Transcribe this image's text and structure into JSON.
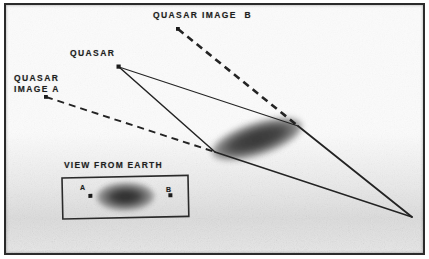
{
  "figure": {
    "background_color": "#fbfbfb",
    "ink_color": "#1e1e1e",
    "frame": {
      "border_color": "#2b2b2b",
      "border_width_px": 2
    }
  },
  "labels": {
    "quasar": "QUASAR",
    "quasar_image_a": "QUASAR\nIMAGE A",
    "quasar_image_b": "QUASAR IMAGE  B",
    "view_from_earth": "VIEW FROM EARTH",
    "inset_a": "A",
    "inset_b": "B"
  },
  "points": {
    "quasar": {
      "x": 113,
      "y": 62,
      "label": "QUASAR"
    },
    "quasar_image_a": {
      "x": 40,
      "y": 92,
      "label": "QUASAR IMAGE A"
    },
    "quasar_image_b": {
      "x": 172,
      "y": 24,
      "label": "QUASAR IMAGE B"
    },
    "observer_earth": {
      "x": 406,
      "y": 212,
      "label": "Earth observer"
    },
    "lens_left_tip": {
      "x": 209,
      "y": 147,
      "label": "lensing galaxy near edge"
    },
    "lens_right_tip": {
      "x": 292,
      "y": 121,
      "label": "lensing galaxy far edge"
    }
  },
  "lens_galaxy": {
    "center_x": 251,
    "center_y": 134,
    "radius_x": 47,
    "radius_y": 16,
    "rotation_deg": -18,
    "fill_color": "#3a3a3a"
  },
  "rays": [
    {
      "name": "ray-quasar-to-lens-near",
      "style": "solid",
      "from": "quasar",
      "to": "lens_left_tip"
    },
    {
      "name": "ray-quasar-to-lens-far",
      "style": "solid",
      "from": "quasar",
      "to": "lens_right_tip"
    },
    {
      "name": "ray-lens-near-to-earth",
      "style": "solid",
      "from": "lens_left_tip",
      "to": "observer_earth"
    },
    {
      "name": "ray-lens-far-to-earth",
      "style": "solid",
      "from": "lens_right_tip",
      "to": "observer_earth"
    },
    {
      "name": "sightline-image-a",
      "style": "dashed",
      "from": "quasar_image_a",
      "to": "observer_earth"
    },
    {
      "name": "sightline-image-b",
      "style": "dashed",
      "from": "quasar_image_b",
      "to": "observer_earth"
    }
  ],
  "inset": {
    "caption": "VIEW FROM EARTH",
    "box": {
      "x": 56,
      "y": 173,
      "width": 126,
      "height": 41,
      "rotation_deg": -1.2
    },
    "galaxy": {
      "center_x": 119,
      "center_y": 193,
      "radius_x": 29,
      "radius_y": 14,
      "fill_color": "#3c3c3c"
    },
    "image_a": {
      "label": "A",
      "dot_x": 83,
      "dot_y": 189
    },
    "image_b": {
      "label": "B",
      "dot_x": 163,
      "dot_y": 191
    }
  }
}
